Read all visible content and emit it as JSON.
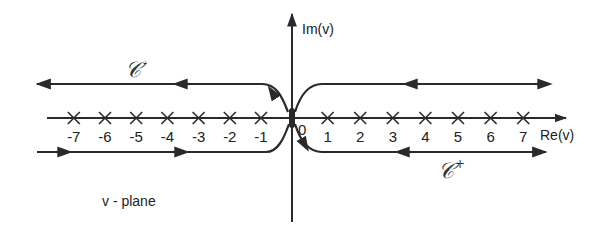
{
  "diagram": {
    "type": "contour-integration",
    "plane_label": "v - plane",
    "axes": {
      "imag_label": "Im(v)",
      "real_label": "Re(v)"
    },
    "origin_label": "0",
    "poles": [
      -7,
      -6,
      -5,
      -4,
      -3,
      -2,
      -1,
      1,
      2,
      3,
      4,
      5,
      6,
      7
    ],
    "pole_labels": [
      "-7",
      "-6",
      "-5",
      "-4",
      "-3",
      "-2",
      "-1",
      "1",
      "2",
      "3",
      "4",
      "5",
      "6",
      "7"
    ],
    "contours": [
      {
        "name": "C-minus",
        "symbol": "𝒞",
        "superscript": "-",
        "side": "left",
        "direction": "clockwise-around-negative-axis"
      },
      {
        "name": "C-plus",
        "symbol": "𝒞",
        "superscript": "+",
        "side": "right",
        "direction": "counterclockwise-around-positive-axis"
      }
    ],
    "stroke_color": "#2a2a2a"
  }
}
